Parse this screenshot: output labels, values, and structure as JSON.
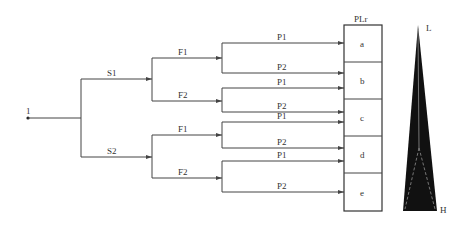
{
  "diagram": {
    "type": "risk-graph",
    "start_label": "1",
    "severity": [
      {
        "label": "S1"
      },
      {
        "label": "S2"
      }
    ],
    "frequency": [
      {
        "label": "F1"
      },
      {
        "label": "F2"
      },
      {
        "label": "F1"
      },
      {
        "label": "F2"
      }
    ],
    "possibility": [
      {
        "label": "P1",
        "target": "a"
      },
      {
        "label": "P2",
        "target": "b"
      },
      {
        "label": "P1",
        "target": "b"
      },
      {
        "label": "P2",
        "target": "c"
      },
      {
        "label": "P1",
        "target": "c"
      },
      {
        "label": "P2",
        "target": "d"
      },
      {
        "label": "P1",
        "target": "d"
      },
      {
        "label": "P2",
        "target": "e"
      }
    ],
    "plr_header": "PLr",
    "plr_levels": [
      "a",
      "b",
      "c",
      "d",
      "e"
    ],
    "scale": {
      "low_label": "L",
      "high_label": "H",
      "fill_color": "#111111"
    }
  }
}
